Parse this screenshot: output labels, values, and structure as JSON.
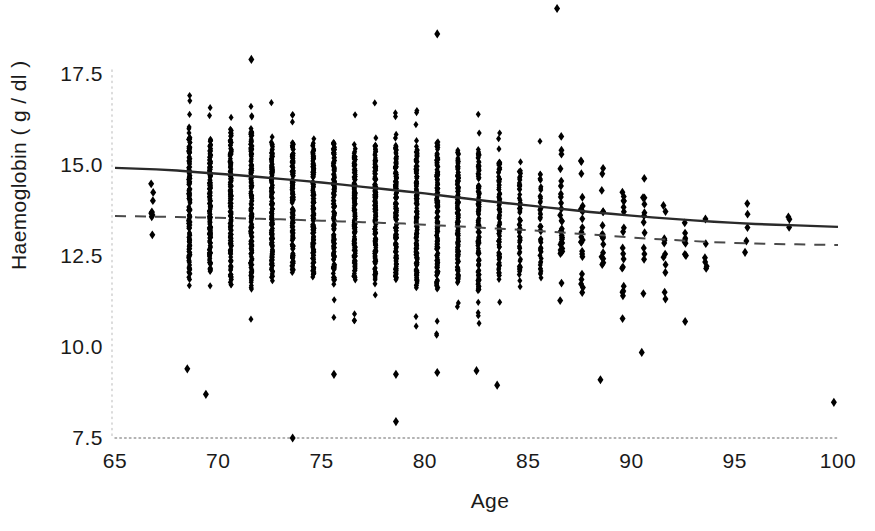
{
  "chart_data": {
    "type": "scatter",
    "title": "",
    "xlabel": "Age",
    "ylabel": "Haemoglobin ( g / dl )",
    "xlim": [
      65,
      100
    ],
    "ylim": [
      7.5,
      18.2
    ],
    "xticks": [
      65,
      70,
      75,
      80,
      85,
      90,
      95,
      100
    ],
    "xtick_labels": [
      "65",
      "70",
      "75",
      "80",
      "85",
      "90",
      "95",
      "100"
    ],
    "yticks": [
      7.5,
      10.0,
      12.5,
      15.0,
      17.5
    ],
    "ytick_labels": [
      "7.5",
      "10.0",
      "12.5",
      "15.0",
      "17.5"
    ],
    "grid": false,
    "legend": "none",
    "marker": "diamond",
    "marker_color": "#000000",
    "axis_color": "#9a9a9a",
    "axis_style": "dotted",
    "point_count_approx": 3000,
    "series": [
      {
        "name": "solid-trend-line",
        "style": "solid",
        "color": "#2a2a2a",
        "points": [
          [
            65.0,
            14.92
          ],
          [
            66.0,
            14.9
          ],
          [
            67.0,
            14.88
          ],
          [
            68.0,
            14.85
          ],
          [
            69.0,
            14.8
          ],
          [
            70.0,
            14.76
          ],
          [
            71.0,
            14.72
          ],
          [
            72.0,
            14.67
          ],
          [
            73.0,
            14.62
          ],
          [
            74.0,
            14.57
          ],
          [
            75.0,
            14.52
          ],
          [
            76.0,
            14.46
          ],
          [
            77.0,
            14.4
          ],
          [
            78.0,
            14.34
          ],
          [
            79.0,
            14.28
          ],
          [
            80.0,
            14.22
          ],
          [
            81.0,
            14.15
          ],
          [
            82.0,
            14.08
          ],
          [
            83.0,
            14.01
          ],
          [
            84.0,
            13.95
          ],
          [
            85.0,
            13.89
          ],
          [
            86.0,
            13.83
          ],
          [
            87.0,
            13.77
          ],
          [
            88.0,
            13.71
          ],
          [
            89.0,
            13.66
          ],
          [
            90.0,
            13.61
          ],
          [
            91.0,
            13.56
          ],
          [
            92.0,
            13.52
          ],
          [
            93.0,
            13.48
          ],
          [
            94.0,
            13.44
          ],
          [
            95.0,
            13.41
          ],
          [
            96.0,
            13.38
          ],
          [
            97.0,
            13.36
          ],
          [
            98.0,
            13.34
          ],
          [
            99.0,
            13.32
          ],
          [
            100.0,
            13.3
          ]
        ]
      },
      {
        "name": "dashed-trend-line",
        "style": "dashed",
        "color": "#4a4a4a",
        "points": [
          [
            65.0,
            13.6
          ],
          [
            66.0,
            13.59
          ],
          [
            67.0,
            13.58
          ],
          [
            68.0,
            13.57
          ],
          [
            69.0,
            13.56
          ],
          [
            70.0,
            13.55
          ],
          [
            71.0,
            13.54
          ],
          [
            72.0,
            13.52
          ],
          [
            73.0,
            13.51
          ],
          [
            74.0,
            13.49
          ],
          [
            75.0,
            13.47
          ],
          [
            76.0,
            13.45
          ],
          [
            77.0,
            13.43
          ],
          [
            78.0,
            13.41
          ],
          [
            79.0,
            13.39
          ],
          [
            80.0,
            13.36
          ],
          [
            81.0,
            13.33
          ],
          [
            82.0,
            13.3
          ],
          [
            83.0,
            13.27
          ],
          [
            84.0,
            13.24
          ],
          [
            85.0,
            13.21
          ],
          [
            86.0,
            13.17
          ],
          [
            87.0,
            13.13
          ],
          [
            88.0,
            13.09
          ],
          [
            89.0,
            13.05
          ],
          [
            90.0,
            13.01
          ],
          [
            91.0,
            12.97
          ],
          [
            92.0,
            12.94
          ],
          [
            93.0,
            12.91
          ],
          [
            94.0,
            12.88
          ],
          [
            95.0,
            12.86
          ],
          [
            96.0,
            12.84
          ],
          [
            97.0,
            12.83
          ],
          [
            98.0,
            12.82
          ],
          [
            99.0,
            12.81
          ],
          [
            100.0,
            12.8
          ]
        ]
      }
    ],
    "strips": [
      {
        "age": 66.8,
        "n": 9,
        "low": 12.5,
        "high": 15.6,
        "center": 14.0
      },
      {
        "age": 68.6,
        "n": 150,
        "low": 10.6,
        "high": 17.0,
        "center": 13.9
      },
      {
        "age": 69.6,
        "n": 150,
        "low": 10.6,
        "high": 16.6,
        "center": 13.9
      },
      {
        "age": 70.6,
        "n": 150,
        "low": 10.8,
        "high": 17.4,
        "center": 13.9
      },
      {
        "age": 71.6,
        "n": 150,
        "low": 10.7,
        "high": 17.6,
        "center": 13.9
      },
      {
        "age": 72.6,
        "n": 145,
        "low": 10.6,
        "high": 16.8,
        "center": 13.8
      },
      {
        "age": 73.6,
        "n": 140,
        "low": 10.5,
        "high": 16.4,
        "center": 13.8
      },
      {
        "age": 74.6,
        "n": 145,
        "low": 10.5,
        "high": 16.6,
        "center": 13.8
      },
      {
        "age": 75.6,
        "n": 140,
        "low": 10.5,
        "high": 16.8,
        "center": 13.8
      },
      {
        "age": 76.6,
        "n": 140,
        "low": 10.6,
        "high": 16.4,
        "center": 13.7
      },
      {
        "age": 77.6,
        "n": 140,
        "low": 10.5,
        "high": 16.8,
        "center": 13.7
      },
      {
        "age": 78.6,
        "n": 140,
        "low": 10.4,
        "high": 16.6,
        "center": 13.7
      },
      {
        "age": 79.6,
        "n": 145,
        "low": 10.3,
        "high": 16.6,
        "center": 13.6
      },
      {
        "age": 80.6,
        "n": 140,
        "low": 10.3,
        "high": 17.0,
        "center": 13.6
      },
      {
        "age": 81.6,
        "n": 130,
        "low": 10.4,
        "high": 16.3,
        "center": 13.6
      },
      {
        "age": 82.6,
        "n": 125,
        "low": 10.5,
        "high": 17.0,
        "center": 13.5
      },
      {
        "age": 83.6,
        "n": 90,
        "low": 10.6,
        "high": 16.1,
        "center": 13.5
      },
      {
        "age": 84.6,
        "n": 60,
        "low": 10.8,
        "high": 16.1,
        "center": 13.5
      },
      {
        "age": 85.6,
        "n": 48,
        "low": 10.7,
        "high": 15.7,
        "center": 13.4
      },
      {
        "age": 86.6,
        "n": 30,
        "low": 10.8,
        "high": 15.9,
        "center": 13.4
      },
      {
        "age": 87.6,
        "n": 22,
        "low": 11.0,
        "high": 15.3,
        "center": 13.3
      },
      {
        "age": 88.6,
        "n": 16,
        "low": 11.2,
        "high": 15.0,
        "center": 13.3
      },
      {
        "age": 89.6,
        "n": 18,
        "low": 10.5,
        "high": 16.1,
        "center": 13.2
      },
      {
        "age": 90.6,
        "n": 12,
        "low": 11.3,
        "high": 15.4,
        "center": 13.2
      },
      {
        "age": 91.6,
        "n": 11,
        "low": 11.3,
        "high": 15.2,
        "center": 13.2
      },
      {
        "age": 92.6,
        "n": 8,
        "low": 11.6,
        "high": 14.4,
        "center": 13.1
      },
      {
        "age": 93.6,
        "n": 6,
        "low": 12.0,
        "high": 14.3,
        "center": 13.1
      },
      {
        "age": 95.6,
        "n": 4,
        "low": 12.6,
        "high": 14.2,
        "center": 13.4
      },
      {
        "age": 97.6,
        "n": 3,
        "low": 12.8,
        "high": 14.0,
        "center": 13.4
      }
    ],
    "outliers": [
      {
        "age": 86.4,
        "value": 19.3
      },
      {
        "age": 80.6,
        "value": 18.6
      },
      {
        "age": 71.6,
        "value": 17.9
      },
      {
        "age": 78.6,
        "value": 7.95
      },
      {
        "age": 73.6,
        "value": 7.5
      },
      {
        "age": 99.8,
        "value": 8.48
      },
      {
        "age": 88.5,
        "value": 9.1
      },
      {
        "age": 90.5,
        "value": 9.85
      },
      {
        "age": 83.5,
        "value": 8.95
      },
      {
        "age": 82.5,
        "value": 9.35
      },
      {
        "age": 80.6,
        "value": 9.3
      },
      {
        "age": 78.6,
        "value": 9.25
      },
      {
        "age": 75.6,
        "value": 9.25
      },
      {
        "age": 69.4,
        "value": 8.7
      },
      {
        "age": 68.5,
        "value": 9.4
      },
      {
        "age": 92.6,
        "value": 10.7
      },
      {
        "age": 95.5,
        "value": 12.6
      }
    ]
  }
}
